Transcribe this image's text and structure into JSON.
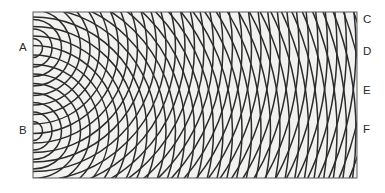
{
  "figure": {
    "type": "two-source-wave-interference-diagram",
    "background_color": "#ffffff",
    "field_color": "#f2f2f0",
    "wave_color": "#2b2b2b",
    "frame_color": "#5a5a5a",
    "frame": {
      "x": 33,
      "y": 12,
      "width": 324,
      "height": 166
    }
  },
  "chart_data": {
    "type": "scatter",
    "title": "",
    "xlabel": "",
    "ylabel": "",
    "grid": false,
    "xlim": [
      33,
      357
    ],
    "ylim": [
      12,
      178
    ],
    "sources": [
      {
        "label": "A",
        "x": 33,
        "y": 48,
        "wavelength": 9.5,
        "fronts": 36
      },
      {
        "label": "B",
        "x": 33,
        "y": 131,
        "wavelength": 9.5,
        "fronts": 36
      }
    ],
    "marked_points": [
      {
        "label": "C",
        "x": 357,
        "y": 20
      },
      {
        "label": "D",
        "x": 357,
        "y": 52
      },
      {
        "label": "E",
        "x": 357,
        "y": 91
      },
      {
        "label": "F",
        "x": 357,
        "y": 130
      }
    ]
  },
  "labels": {
    "source_a": "A",
    "source_b": "B",
    "point_c": "C",
    "point_d": "D",
    "point_e": "E",
    "point_f": "F"
  }
}
